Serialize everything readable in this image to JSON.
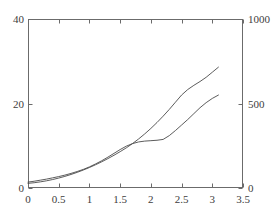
{
  "chart_data": {
    "type": "line",
    "title": "",
    "subtitle": "",
    "xlabel": "",
    "ylabel": "",
    "y2label": "",
    "grid": false,
    "legend": "none",
    "xlim": [
      0,
      3.5
    ],
    "ylim": [
      0,
      40
    ],
    "y2lim": [
      0,
      1000
    ],
    "x_ticks": [
      0,
      0.5,
      1,
      1.5,
      2,
      2.5,
      3,
      3.5
    ],
    "x_tick_labels": [
      "0",
      "0.5",
      "1",
      "1.5",
      "2",
      "2.5",
      "3",
      "3.5"
    ],
    "y_ticks": [
      0,
      20,
      40
    ],
    "y_tick_labels": [
      "0",
      "20",
      "40"
    ],
    "y2_ticks": [
      0,
      500,
      1000
    ],
    "y2_tick_labels": [
      "0",
      "500",
      "1000"
    ],
    "line_color": "#4a4a4a",
    "axis_color": "#6b6b6b",
    "series": [
      {
        "name": "curve-upper",
        "axis": "left",
        "x": [
          0.0,
          0.1,
          0.2,
          0.3,
          0.4,
          0.5,
          0.6,
          0.7,
          0.8,
          0.9,
          1.0,
          1.1,
          1.2,
          1.3,
          1.4,
          1.5,
          1.6,
          1.7,
          1.8,
          1.9,
          2.0,
          2.1,
          2.2,
          2.3,
          2.4,
          2.5,
          2.6,
          2.7,
          2.8,
          2.9,
          3.0,
          3.1
        ],
        "y": [
          1.1,
          1.25,
          1.45,
          1.7,
          2.0,
          2.35,
          2.75,
          3.2,
          3.7,
          4.25,
          4.85,
          5.5,
          6.2,
          6.95,
          7.75,
          8.6,
          9.5,
          10.5,
          11.6,
          12.8,
          14.1,
          15.5,
          17.0,
          18.6,
          20.3,
          22.0,
          23.3,
          24.3,
          25.2,
          26.2,
          27.4,
          28.6
        ]
      },
      {
        "name": "curve-lower",
        "axis": "left",
        "x": [
          0.0,
          0.1,
          0.2,
          0.3,
          0.4,
          0.5,
          0.6,
          0.7,
          0.8,
          0.9,
          1.0,
          1.1,
          1.2,
          1.3,
          1.4,
          1.5,
          1.6,
          1.7,
          1.8,
          1.9,
          2.0,
          2.1,
          2.2,
          2.3,
          2.4,
          2.5,
          2.6,
          2.7,
          2.8,
          2.9,
          3.0,
          3.1
        ],
        "y": [
          1.4,
          1.6,
          1.85,
          2.1,
          2.4,
          2.7,
          3.05,
          3.45,
          3.9,
          4.4,
          5.0,
          5.7,
          6.45,
          7.3,
          8.2,
          9.1,
          9.9,
          10.5,
          10.9,
          11.1,
          11.2,
          11.3,
          11.5,
          12.4,
          13.6,
          14.9,
          16.2,
          17.6,
          19.0,
          20.2,
          21.2,
          22.0
        ]
      }
    ]
  },
  "axes_geometry": {
    "left_px": 28,
    "right_px": 243,
    "top_px": 19,
    "bottom_px": 188
  }
}
